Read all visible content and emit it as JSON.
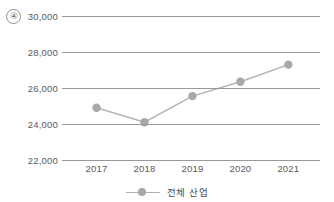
{
  "item_number": "④",
  "legend": {
    "entries": [
      {
        "label": "전체 산업",
        "color": "#a8a8a8",
        "marker": "circle-marker"
      }
    ]
  },
  "axes": {
    "y_ticks": [
      "30,000",
      "28,000",
      "26,000",
      "24,000",
      "22,000"
    ],
    "x_ticks": [
      "2017",
      "2018",
      "2019",
      "2020",
      "2021"
    ]
  },
  "colors": {
    "series": "#a8a8a8",
    "line": "#b4b4b4",
    "gridline": "#999999",
    "text": "#595959"
  },
  "chart_data": {
    "type": "line",
    "title": "",
    "xlabel": "",
    "ylabel": "",
    "categories": [
      "2017",
      "2018",
      "2019",
      "2020",
      "2021"
    ],
    "series": [
      {
        "name": "전체 산업",
        "values": [
          24900,
          24100,
          25550,
          26350,
          27300
        ],
        "color": "#a8a8a8",
        "marker": "circle"
      }
    ],
    "ylim": [
      22000,
      30000
    ],
    "yticks": [
      22000,
      24000,
      26000,
      28000,
      30000
    ],
    "ytick_labels": [
      "22,000",
      "24,000",
      "26,000",
      "28,000",
      "30,000"
    ],
    "grid": "horizontal",
    "legend_position": "bottom-center"
  }
}
